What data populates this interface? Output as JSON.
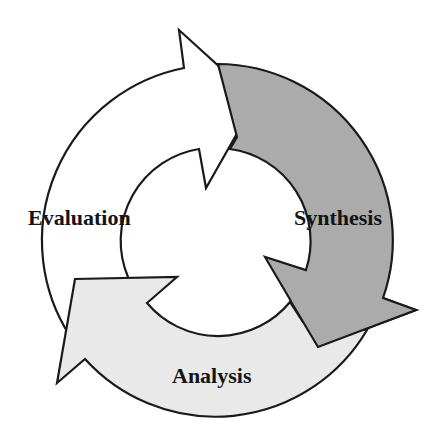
{
  "diagram": {
    "type": "cycle",
    "direction": "clockwise",
    "stages": [
      {
        "label": "Evaluation",
        "color": "#ffffff"
      },
      {
        "label": "Synthesis",
        "color": "#ababab"
      },
      {
        "label": "Analysis",
        "color": "#e9e9e9"
      }
    ],
    "stroke_color": "#1a1a1a"
  }
}
